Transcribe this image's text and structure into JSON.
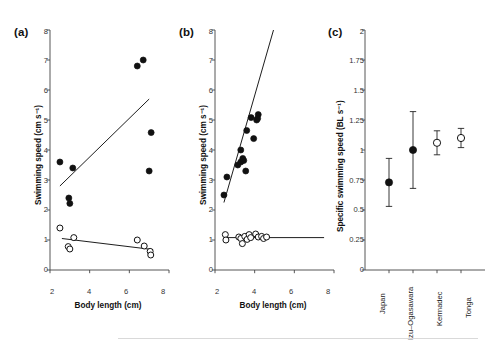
{
  "figure": {
    "background": "#ffffff",
    "marker_filled_color": "#111111",
    "marker_open_color": "#ffffff",
    "marker_stroke_color": "#111111",
    "line_color": "#111111"
  },
  "panels": [
    {
      "label": "(a)",
      "xlabel": "Body length (cm)",
      "ylabel": "Swimming speed (cm s⁻¹)"
    },
    {
      "label": "(b)",
      "xlabel": "Body length (cm)",
      "ylabel": "Swimming speed (cm s⁻¹)"
    },
    {
      "label": "(c)",
      "xlabel": "",
      "ylabel": "Specific swimming speed (BL s⁻¹)"
    }
  ],
  "chart_data": [
    {
      "type": "scatter",
      "panel": "(a)",
      "title": "",
      "xlabel": "Body length (cm)",
      "ylabel": "Swimming speed (cm s⁻¹)",
      "xlim": [
        2,
        8
      ],
      "ylim": [
        0,
        8
      ],
      "xticks": [
        2,
        4,
        6,
        8
      ],
      "yticks": [
        0,
        1,
        2,
        3,
        4,
        5,
        6,
        7,
        8
      ],
      "grid": false,
      "legend": "none",
      "series": [
        {
          "name": "filled-circles",
          "marker": "filled",
          "points": [
            {
              "x": 2.5,
              "y": 3.6
            },
            {
              "x": 3.15,
              "y": 3.4
            },
            {
              "x": 2.95,
              "y": 2.4
            },
            {
              "x": 3.0,
              "y": 2.22
            },
            {
              "x": 6.4,
              "y": 6.8
            },
            {
              "x": 6.7,
              "y": 7.0
            },
            {
              "x": 7.1,
              "y": 4.58
            },
            {
              "x": 7.0,
              "y": 3.3
            }
          ],
          "fit_line": {
            "x0": 2.5,
            "y0": 2.8,
            "x1": 7.0,
            "y1": 5.7
          }
        },
        {
          "name": "open-circles",
          "marker": "open",
          "points": [
            {
              "x": 2.5,
              "y": 1.4
            },
            {
              "x": 3.2,
              "y": 1.08
            },
            {
              "x": 2.92,
              "y": 0.78
            },
            {
              "x": 3.0,
              "y": 0.7
            },
            {
              "x": 6.4,
              "y": 1.0
            },
            {
              "x": 6.75,
              "y": 0.8
            },
            {
              "x": 7.05,
              "y": 0.62
            },
            {
              "x": 7.08,
              "y": 0.5
            }
          ],
          "fit_line": {
            "x0": 2.6,
            "y0": 1.05,
            "x1": 7.2,
            "y1": 0.68
          }
        }
      ]
    },
    {
      "type": "scatter",
      "panel": "(b)",
      "title": "",
      "xlabel": "Body length (cm)",
      "ylabel": "Swimming speed (cm s⁻¹)",
      "xlim": [
        2,
        8
      ],
      "ylim": [
        0,
        8
      ],
      "xticks": [
        2,
        4,
        6,
        8
      ],
      "yticks": [
        0,
        1,
        2,
        3,
        4,
        5,
        6,
        7,
        8
      ],
      "grid": false,
      "legend": "none",
      "series": [
        {
          "name": "filled-circles",
          "marker": "filled",
          "points": [
            {
              "x": 2.45,
              "y": 2.5
            },
            {
              "x": 2.6,
              "y": 3.1
            },
            {
              "x": 3.15,
              "y": 3.5
            },
            {
              "x": 3.3,
              "y": 3.6
            },
            {
              "x": 3.45,
              "y": 3.65
            },
            {
              "x": 3.4,
              "y": 3.72
            },
            {
              "x": 3.55,
              "y": 3.3
            },
            {
              "x": 3.3,
              "y": 4.0
            },
            {
              "x": 3.6,
              "y": 4.65
            },
            {
              "x": 3.82,
              "y": 5.08
            },
            {
              "x": 3.95,
              "y": 4.38
            },
            {
              "x": 4.1,
              "y": 5.0
            },
            {
              "x": 4.18,
              "y": 5.18
            },
            {
              "x": 4.15,
              "y": 5.05
            }
          ],
          "fit_line": {
            "x0": 2.45,
            "y0": 2.25,
            "x1": 4.95,
            "y1": 8.0
          }
        },
        {
          "name": "open-circles",
          "marker": "open",
          "points": [
            {
              "x": 2.52,
              "y": 1.18
            },
            {
              "x": 2.55,
              "y": 1.0
            },
            {
              "x": 3.2,
              "y": 1.1
            },
            {
              "x": 3.3,
              "y": 1.05
            },
            {
              "x": 3.38,
              "y": 0.88
            },
            {
              "x": 3.5,
              "y": 1.12
            },
            {
              "x": 3.62,
              "y": 1.02
            },
            {
              "x": 3.72,
              "y": 1.18
            },
            {
              "x": 3.8,
              "y": 1.08
            },
            {
              "x": 4.05,
              "y": 1.2
            },
            {
              "x": 4.18,
              "y": 1.1
            },
            {
              "x": 4.35,
              "y": 1.12
            },
            {
              "x": 4.45,
              "y": 1.05
            },
            {
              "x": 4.6,
              "y": 1.1
            }
          ],
          "fit_line": {
            "x0": 2.45,
            "y0": 1.08,
            "x1": 7.5,
            "y1": 1.08
          }
        }
      ]
    },
    {
      "type": "scatter",
      "panel": "(c)",
      "title": "",
      "xlabel": "",
      "ylabel": "Specific swimming speed (BL s⁻¹)",
      "categories": [
        "Japan",
        "Izu–Ogasawara",
        "Kermadec",
        "Tonga"
      ],
      "values": [
        0.73,
        1.0,
        1.06,
        1.1
      ],
      "err_low": [
        0.53,
        0.68,
        0.96,
        1.02
      ],
      "err_high": [
        0.93,
        1.32,
        1.16,
        1.18
      ],
      "markers": [
        "filled",
        "filled",
        "open",
        "open"
      ],
      "ylim": [
        0,
        2
      ],
      "yticks": [
        0,
        0.25,
        0.5,
        0.75,
        1,
        1.25,
        1.5,
        1.75,
        2
      ],
      "ytick_labels": [
        "0",
        "0.25",
        "0.5",
        "0.75",
        "1",
        "1.25",
        "1.5",
        "1.75",
        "2"
      ],
      "grid": false,
      "legend": "none"
    }
  ]
}
